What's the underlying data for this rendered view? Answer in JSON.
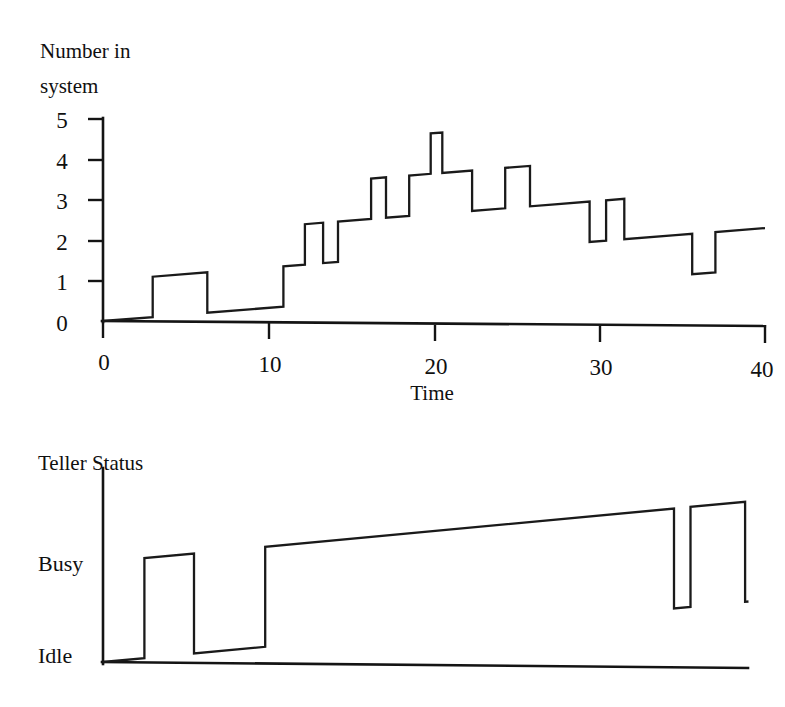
{
  "figure": {
    "background": "#ffffff",
    "ink_color": "#141414"
  },
  "top_chart": {
    "y_axis_title_line1": "Number in",
    "y_axis_title_line2": "system",
    "x_axis_title": "Time",
    "y_ticks": [
      "0",
      "1",
      "2",
      "3",
      "4",
      "5"
    ],
    "x_ticks": [
      "0",
      "10",
      "20",
      "30",
      "40"
    ]
  },
  "bottom_chart": {
    "title": "Teller Status",
    "y_ticks": [
      "Idle",
      "Busy"
    ]
  },
  "chart_data": [
    {
      "type": "line",
      "subtype": "step",
      "title": "Number in system",
      "xlabel": "Time",
      "ylabel": "Number in system",
      "xlim": [
        0,
        40
      ],
      "ylim": [
        0,
        5
      ],
      "grid": false,
      "legend": null,
      "xticks": [
        0,
        10,
        20,
        30,
        40
      ],
      "yticks": [
        0,
        1,
        2,
        3,
        4,
        5
      ],
      "step_mode": "post",
      "x": [
        0,
        3.0,
        6.3,
        10.9,
        12.2,
        13.3,
        14.2,
        16.2,
        17.1,
        18.5,
        19.8,
        20.5,
        22.3,
        24.3,
        25.8,
        27.3,
        29.4,
        30.4,
        31.5,
        34.6,
        35.6,
        37.0,
        39.0
      ],
      "values": [
        0,
        1,
        0,
        1,
        2,
        1,
        2,
        3,
        2,
        3,
        4,
        3,
        2,
        3,
        2,
        2,
        1,
        2,
        1,
        1,
        0,
        1,
        1
      ],
      "annotations": []
    },
    {
      "type": "line",
      "subtype": "step",
      "title": "Teller Status",
      "xlabel": "",
      "ylabel": "Teller Status",
      "xlim": [
        0,
        40
      ],
      "ylim": [
        0,
        1
      ],
      "grid": false,
      "legend": null,
      "yticklabels": [
        "Idle",
        "Busy"
      ],
      "yticks": [
        0,
        1
      ],
      "step_mode": "post",
      "x": [
        0,
        2.5,
        5.5,
        9.8,
        34.5,
        35.5,
        38.8
      ],
      "values": [
        0,
        1,
        0,
        1,
        0,
        1,
        0
      ],
      "annotations": []
    }
  ]
}
